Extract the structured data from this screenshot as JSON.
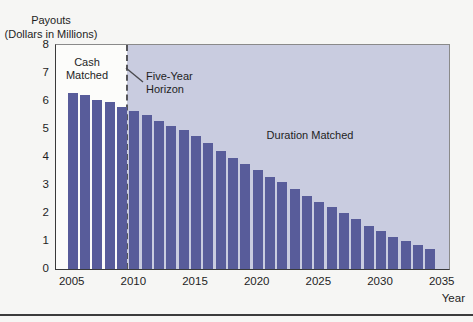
{
  "figure_title": "Payouts (Dollars in Millions) by Year",
  "colors": {
    "bar": "#585c9a",
    "duration_region": "#c9cce0",
    "cash_region": "#fcfcfa",
    "page_bg": "#f6f6f4",
    "divider": "#56565a",
    "rule": "#3c3c3c",
    "text": "#1e1e1e",
    "plot_border": "#8a8a8a",
    "axis_dark": "#3a3a3a"
  },
  "chart_data": {
    "type": "bar",
    "title": "Payouts (Dollars in Millions)",
    "y_axis_title_line1": "Payouts",
    "y_axis_title_line2": "(Dollars in Millions)",
    "xlabel": "Year",
    "ylabel": "Payouts (Dollars in Millions)",
    "x": [
      2005,
      2006,
      2007,
      2008,
      2009,
      2010,
      2011,
      2012,
      2013,
      2014,
      2015,
      2016,
      2017,
      2018,
      2019,
      2020,
      2021,
      2022,
      2023,
      2024,
      2025,
      2026,
      2027,
      2028,
      2029,
      2030,
      2031,
      2032,
      2033,
      2034
    ],
    "values": [
      6.3,
      6.2,
      6.05,
      5.95,
      5.8,
      5.65,
      5.5,
      5.3,
      5.1,
      4.95,
      4.75,
      4.5,
      4.2,
      3.95,
      3.75,
      3.55,
      3.3,
      3.1,
      2.85,
      2.6,
      2.4,
      2.2,
      2.0,
      1.8,
      1.55,
      1.35,
      1.15,
      1.0,
      0.85,
      0.7
    ],
    "ylim": [
      0,
      8
    ],
    "yticks": [
      0,
      1,
      2,
      3,
      4,
      5,
      6,
      7,
      8
    ],
    "xticks": [
      2005,
      2010,
      2015,
      2020,
      2025,
      2030,
      2035
    ],
    "grid": false,
    "legend": "none",
    "annotations": {
      "cash_region_label": "Cash Matched",
      "duration_region_label": "Duration Matched",
      "divider_label": "Five-Year Horizon",
      "divider_x": 2009.5
    }
  }
}
